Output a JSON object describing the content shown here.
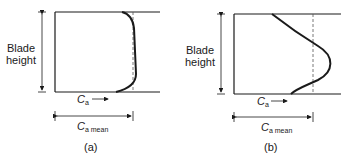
{
  "diagram": {
    "panels": [
      {
        "id": "a",
        "caption": "(a)",
        "axis_label_line1": "Blade",
        "axis_label_line2": "height",
        "velocity_label": "C",
        "velocity_sub": "a",
        "mean_label": "C",
        "mean_sub": "a mean",
        "profile": "nearly uniform, drops sharply near walls"
      },
      {
        "id": "b",
        "caption": "(b)",
        "axis_label_line1": "Blade",
        "axis_label_line2": "height",
        "velocity_label": "C",
        "velocity_sub": "a",
        "mean_label": "C",
        "mean_sub": "a mean",
        "profile": "peaked at mid-height"
      }
    ],
    "colors": {
      "line": "#1a1a1a",
      "dashed": "#555555"
    }
  }
}
